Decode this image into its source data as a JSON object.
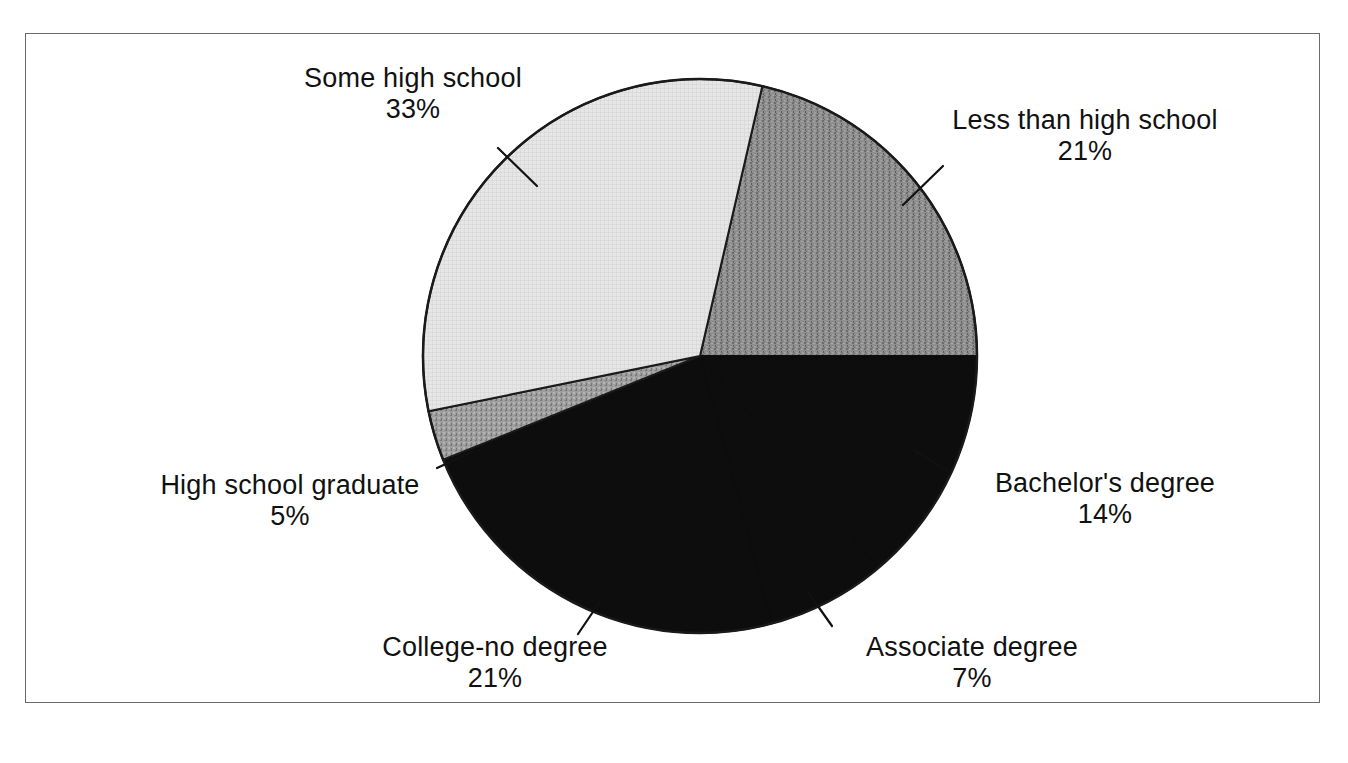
{
  "chart_data": {
    "type": "pie",
    "title": "",
    "subtitle": "",
    "xlabel": "",
    "ylabel": "",
    "legend_position": "none",
    "grid": false,
    "labels_outside": true,
    "total_percent": 101,
    "units": "percent",
    "categories": [
      "Less than high school",
      "Bachelor's degree",
      "Associate degree",
      "College-no degree",
      "High school graduate",
      "Some high school"
    ],
    "values": [
      21,
      14,
      7,
      21,
      5,
      33
    ],
    "slices": [
      {
        "label": "Less than high school",
        "value": 21,
        "value_text": "21%",
        "fill": "#8a8a8a",
        "pattern": "noise-medium",
        "start_deg": 13.0,
        "end_deg": 90.0,
        "label_position": "right-top"
      },
      {
        "label": "Bachelor's degree",
        "value": 14,
        "value_text": "14%",
        "fill": "#0d0d0d",
        "pattern": "solid",
        "start_deg": 90.0,
        "end_deg": 140.0,
        "label_position": "right"
      },
      {
        "label": "Associate degree",
        "value": 7,
        "value_text": "7%",
        "fill": "#0d0d0d",
        "pattern": "solid",
        "start_deg": 140.0,
        "end_deg": 165.0,
        "label_position": "bottom-right"
      },
      {
        "label": "College-no degree",
        "value": 21,
        "value_text": "21%",
        "fill": "#0d0d0d",
        "pattern": "solid",
        "start_deg": 165.0,
        "end_deg": 248.0,
        "label_position": "bottom-left"
      },
      {
        "label": "High school graduate",
        "value": 5,
        "value_text": "5%",
        "fill": "#9a9a9a",
        "pattern": "noise-light",
        "start_deg": 248.0,
        "end_deg": 258.5,
        "label_position": "left"
      },
      {
        "label": "Some high school",
        "value": 33,
        "value_text": "33%",
        "fill": "#e3e3e3",
        "pattern": "crosshatch-fine",
        "start_deg": 258.5,
        "end_deg": 373.0,
        "label_position": "left-top"
      }
    ],
    "geometry": {
      "center_x": 700,
      "center_y": 356,
      "radius": 277,
      "outline_color": "#1a1a1a",
      "outline_width": 2
    },
    "leader_lines": [
      {
        "for": "Some high school",
        "x1": 498,
        "y1": 148,
        "x2": 537,
        "y2": 184
      },
      {
        "for": "Less than high school",
        "x1": 940,
        "y1": 168,
        "x2": 900,
        "y2": 203
      },
      {
        "for": "Bachelor's degree",
        "x1": 948,
        "y1": 470,
        "x2": 912,
        "y2": 448
      },
      {
        "for": "Associate degree",
        "x1": 830,
        "y1": 624,
        "x2": 806,
        "y2": 590
      },
      {
        "for": "College-no degree",
        "x1": 578,
        "y1": 632,
        "x2": 600,
        "y2": 600
      },
      {
        "for": "High school graduate",
        "x1": 440,
        "y1": 466,
        "x2": 474,
        "y2": 450
      }
    ]
  },
  "labels": {
    "some_high_school": {
      "name": "Some high school",
      "value": "33%"
    },
    "less_than_high_school": {
      "name": "Less than high school",
      "value": "21%"
    },
    "bachelors_degree": {
      "name": "Bachelor's degree",
      "value": "14%"
    },
    "associate_degree": {
      "name": "Associate degree",
      "value": "7%"
    },
    "college_no_degree": {
      "name": "College-no degree",
      "value": "21%"
    },
    "high_school_graduate": {
      "name": "High school graduate",
      "value": "5%"
    }
  },
  "colors": {
    "background": "#ffffff",
    "frame": "#6b6b6b",
    "text": "#111111",
    "slice_light": "#e3e3e3",
    "slice_medium": "#9a9a9a",
    "slice_dark": "#8a8a8a",
    "slice_black": "#0d0d0d"
  }
}
